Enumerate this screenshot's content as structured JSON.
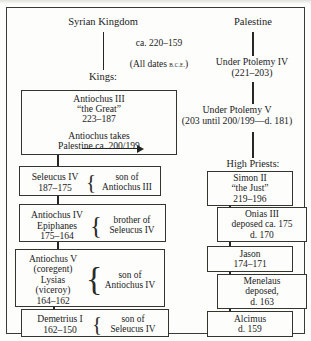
{
  "figure": {
    "outer_frame": true,
    "note_center": {
      "line1": "ca. 220–159",
      "line2_pre": "(All dates ",
      "line2_sc": "B.C.E.",
      "line2_post": ")"
    }
  },
  "columns": {
    "left": {
      "heading": "Syrian Kingdom",
      "subheading": "Kings:"
    },
    "right": {
      "heading": "Palestine",
      "stage1": "Under Ptolemy IV\n(221–203)",
      "stage2": "Under Ptolemy V\n(203 until 200/199—d. 181)",
      "subheading": "High Priests:"
    }
  },
  "left_boxes": [
    {
      "name": "antiochus-iii",
      "text": "Antiochus III\n“the Great”\n223–187",
      "note": "Antiochus takes\nPalestine ca. 200/199",
      "has_arrow": true
    },
    {
      "name": "seleucus-iv",
      "text": "Seleucus IV\n187–175",
      "relation": "son of\nAntiochus III"
    },
    {
      "name": "antiochus-iv-epiphanes",
      "text": "Antiochus IV\nEpiphanes\n175–164",
      "relation": "brother of\nSeleucus IV"
    },
    {
      "name": "antiochus-v-lysias",
      "text": "Antiochus V\n(coregent)\nLysias\n(viceroy)\n164–162",
      "relation": "son of\nAntiochus IV"
    },
    {
      "name": "demetrius-i",
      "text": "Demetrius I\n162–150",
      "relation": "son of\nSeleucus IV"
    }
  ],
  "right_boxes": [
    {
      "name": "simon-ii",
      "text": "Simon II\n“the Just”\n219–196"
    },
    {
      "name": "onias-iii",
      "text": "Onias III\ndeposed ca. 175\nd. 170"
    },
    {
      "name": "jason",
      "text": "Jason\n174–171"
    },
    {
      "name": "menelaus",
      "text": "Menelaus\ndeposed,\nd. 163"
    },
    {
      "name": "alcimus",
      "text": "Alcimus\nd. 159"
    }
  ]
}
